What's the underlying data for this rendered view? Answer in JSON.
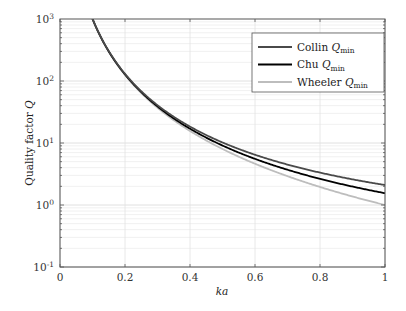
{
  "chart_data": {
    "type": "line",
    "title": "",
    "xlabel": "ka",
    "ylabel": "Quality factor Q",
    "xlim": [
      0,
      1
    ],
    "ylim": [
      0.1,
      1000
    ],
    "yscale": "log",
    "grid": true,
    "legend_position": "upper right",
    "x_ticks": [
      "0",
      "0.2",
      "0.4",
      "0.6",
      "0.8",
      "1"
    ],
    "y_ticks": [
      {
        "base": "10",
        "exp": "-1"
      },
      {
        "base": "10",
        "exp": "0"
      },
      {
        "base": "10",
        "exp": "1"
      },
      {
        "base": "10",
        "exp": "2"
      },
      {
        "base": "10",
        "exp": "3"
      }
    ],
    "series": [
      {
        "name": "Collin Q_min",
        "label_main": "Collin ",
        "label_q": "Q",
        "label_sub": "min",
        "color": "#4a4a4a",
        "formula": "collin",
        "sample_values": {
          "0.2": 136,
          "0.4": 18,
          "0.6": 6.5,
          "0.8": 3.2,
          "1.0": 2.1
        }
      },
      {
        "name": "Chu Q_min",
        "label_main": "Chu ",
        "label_q": "Q",
        "label_sub": "min",
        "color": "#000000",
        "formula": "chu",
        "sample_values": {
          "0.2": 130,
          "0.4": 17,
          "0.6": 5.8,
          "0.8": 2.7,
          "1.0": 1.5
        }
      },
      {
        "name": "Wheeler Q_min",
        "label_main": "Wheeler ",
        "label_q": "Q",
        "label_sub": "min",
        "color": "#bdbdbd",
        "formula": "wheeler",
        "sample_values": {
          "0.1": 1000,
          "0.2": 125,
          "0.4": 15.6,
          "0.6": 4.6,
          "0.8": 2.0,
          "1.0": 1.0
        }
      }
    ]
  }
}
